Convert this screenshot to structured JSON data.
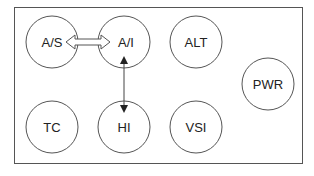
{
  "diagram": {
    "type": "instrument-layout",
    "instruments": [
      {
        "id": "as",
        "label": "A/S",
        "cx": 52,
        "cy": 42
      },
      {
        "id": "ai",
        "label": "A/I",
        "cx": 124,
        "cy": 42
      },
      {
        "id": "alt",
        "label": "ALT",
        "cx": 196,
        "cy": 42
      },
      {
        "id": "pwr",
        "label": "PWR",
        "cx": 268,
        "cy": 84
      },
      {
        "id": "tc",
        "label": "TC",
        "cx": 52,
        "cy": 127
      },
      {
        "id": "hi",
        "label": "HI",
        "cx": 124,
        "cy": 127
      },
      {
        "id": "vsi",
        "label": "VSI",
        "cx": 196,
        "cy": 127
      }
    ],
    "connections": [
      {
        "from": "A/S",
        "to": "A/I",
        "style": "double-outline-arrow"
      },
      {
        "from": "A/I",
        "to": "HI",
        "style": "double-line-arrow"
      }
    ],
    "colors": {
      "stroke": "#555555",
      "text": "#222222",
      "background": "#ffffff"
    }
  }
}
